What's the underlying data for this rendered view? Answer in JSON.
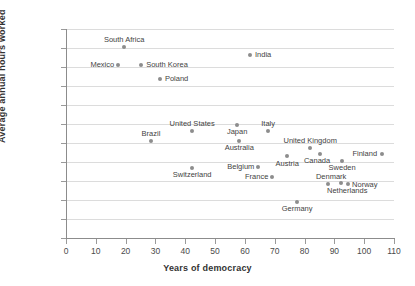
{
  "chart_data": {
    "type": "scatter",
    "title": "",
    "xlabel": "Years of democracy",
    "ylabel": "Average annual hours worked",
    "xlim": [
      0,
      110
    ],
    "ylim": [
      1200,
      2300
    ],
    "xticks": [
      0,
      10,
      20,
      30,
      40,
      50,
      60,
      70,
      80,
      90,
      100,
      110
    ],
    "yticks": [
      "1,200",
      "1,300",
      "1,400",
      "1,500",
      "1,600",
      "1,700",
      "1,800",
      "1,900",
      "2,000",
      "2,100",
      "2,200",
      "2,300"
    ],
    "grid": true,
    "legend": "none",
    "point_color": "#8d8d8d",
    "points": [
      {
        "label": "South Africa",
        "x": 19.5,
        "y": 2205,
        "lab": "above",
        "dx": 0,
        "dy": -4
      },
      {
        "label": "Mexico",
        "x": 17.5,
        "y": 2110,
        "lab": "left",
        "dx": -4,
        "dy": 0
      },
      {
        "label": "South Korea",
        "x": 25.2,
        "y": 2110,
        "lab": "right",
        "dx": 5,
        "dy": 0
      },
      {
        "label": "Poland",
        "x": 31.5,
        "y": 2038,
        "lab": "right",
        "dx": 5,
        "dy": 0
      },
      {
        "label": "India",
        "x": 61.7,
        "y": 2162,
        "lab": "right",
        "dx": 5,
        "dy": 0
      },
      {
        "label": "Brazil",
        "x": 28.5,
        "y": 1712,
        "lab": "above",
        "dx": 0,
        "dy": -4
      },
      {
        "label": "United States",
        "x": 42.3,
        "y": 1765,
        "lab": "above",
        "dx": 0,
        "dy": -4
      },
      {
        "label": "Japan",
        "x": 57.4,
        "y": 1797,
        "lab": "below",
        "dx": 0,
        "dy": 3
      },
      {
        "label": "Italy",
        "x": 67.8,
        "y": 1765,
        "lab": "above",
        "dx": 0,
        "dy": -4
      },
      {
        "label": "Australia",
        "x": 58.1,
        "y": 1712,
        "lab": "below",
        "dx": 0,
        "dy": 3
      },
      {
        "label": "United Kingdom",
        "x": 81.9,
        "y": 1675,
        "lab": "above",
        "dx": 0,
        "dy": -4
      },
      {
        "label": "Canada",
        "x": 85.2,
        "y": 1643,
        "lab": "below",
        "dx": -3,
        "dy": 3
      },
      {
        "label": "Finland",
        "x": 106.0,
        "y": 1643,
        "lab": "left",
        "dx": -5,
        "dy": 0
      },
      {
        "label": "Sweden",
        "x": 92.6,
        "y": 1607,
        "lab": "below",
        "dx": 0,
        "dy": 3
      },
      {
        "label": "Austria",
        "x": 74.2,
        "y": 1633,
        "lab": "below",
        "dx": 0,
        "dy": 4
      },
      {
        "label": "Belgium",
        "x": 64.5,
        "y": 1575,
        "lab": "left",
        "dx": -4,
        "dy": 0
      },
      {
        "label": "Switzerland",
        "x": 42.3,
        "y": 1570,
        "lab": "below",
        "dx": 0,
        "dy": 3
      },
      {
        "label": "France",
        "x": 69.2,
        "y": 1520,
        "lab": "left",
        "dx": -4,
        "dy": 0
      },
      {
        "label": "Denmark",
        "x": 87.9,
        "y": 1483,
        "lab": "above",
        "dx": 3,
        "dy": -4
      },
      {
        "label": "Netherlands",
        "x": 92.3,
        "y": 1488,
        "lab": "below",
        "dx": 6,
        "dy": 4
      },
      {
        "label": "Norway",
        "x": 94.6,
        "y": 1486,
        "lab": "right",
        "dx": 4,
        "dy": 1
      },
      {
        "label": "Germany",
        "x": 77.5,
        "y": 1388,
        "lab": "below",
        "dx": 0,
        "dy": 3
      }
    ]
  }
}
